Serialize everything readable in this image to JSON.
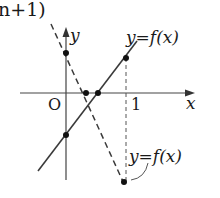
{
  "header_fragment": "n+1)",
  "axes": {
    "x_label": "x",
    "y_label": "y",
    "origin_label": "O",
    "tick_labels": [
      "1"
    ]
  },
  "curves": [
    {
      "name": "solid-line",
      "label": "y=f(x)",
      "style": "solid"
    },
    {
      "name": "dashed-line",
      "label": "y=f(x)",
      "style": "dashed"
    }
  ],
  "colors": {
    "ink": "#3a3a3a",
    "text": "#1a1a1a"
  }
}
